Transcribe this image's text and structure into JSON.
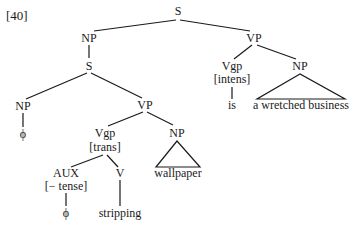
{
  "example_number": "[40]",
  "nodes": {
    "root_s": "S",
    "subj_np": "NP",
    "emb_s": "S",
    "emb_np": "NP",
    "emb_np_leaf": "ϕ",
    "emb_vp": "VP",
    "emb_vgp": "Vgp",
    "emb_vgp_feature": "[trans]",
    "aux": "AUX",
    "aux_feature": "[− tense]",
    "aux_leaf": "ϕ",
    "v": "V",
    "v_leaf": "stripping",
    "obj_np": "NP",
    "obj_np_leaf": "wallpaper",
    "main_vp": "VP",
    "main_vgp": "Vgp",
    "main_vgp_feature": "[intens]",
    "main_vgp_leaf": "is",
    "pred_np": "NP",
    "pred_np_leaf": "a wretched business"
  },
  "colors": {
    "ink": "#1a1a1a",
    "background": "#ffffff"
  }
}
